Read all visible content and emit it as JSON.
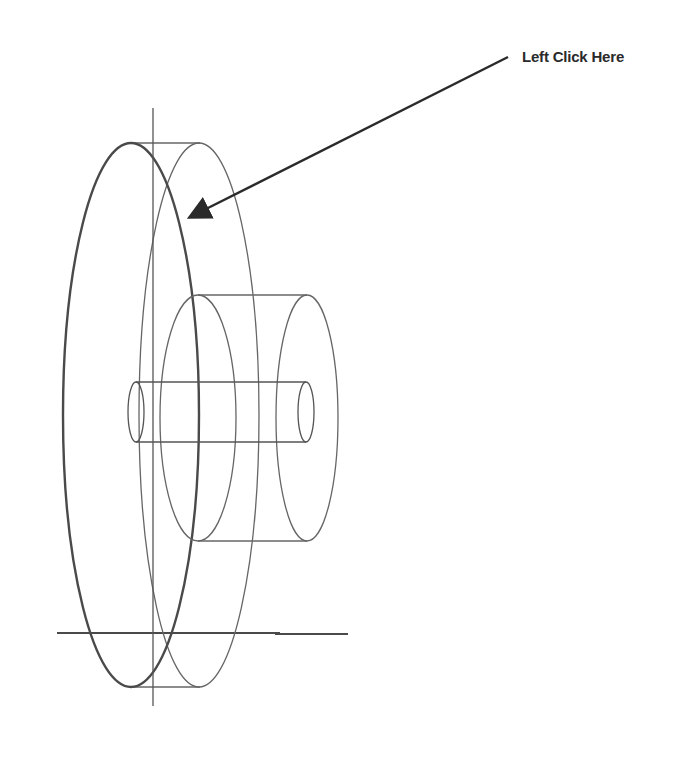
{
  "annotation": {
    "label": "Left Click Here",
    "arrow_from": [
      508,
      57
    ],
    "arrow_to": [
      190,
      217
    ]
  },
  "colors": {
    "background": "#ffffff",
    "stroke": "#555555",
    "thick_stroke": "#4a4a4a",
    "arrow": "#2a2a2a",
    "text": "#2a2a2a"
  },
  "drawing": {
    "description": "Wireframe isometric view of a wheel (disk) with hub and axle",
    "parts": [
      "disk",
      "hub",
      "axle",
      "center-axis",
      "ground-line"
    ]
  }
}
